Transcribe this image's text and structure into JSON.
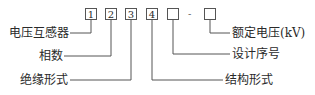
{
  "diagram": {
    "boxes": [
      "1",
      "2",
      "3",
      "4",
      "",
      ""
    ],
    "separator": "-",
    "labels": {
      "box1": "电压互感器",
      "box2": "相数",
      "box3": "绝缘形式",
      "box4": "结构形式",
      "box5": "设计序号",
      "box6": "额定电压(kV)"
    }
  }
}
